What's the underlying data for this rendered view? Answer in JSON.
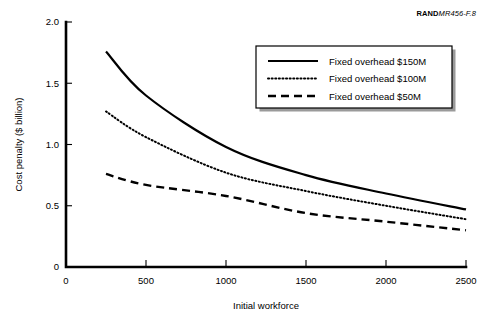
{
  "source_tag": {
    "rand_mark": "RAND",
    "doc_id": "MR456-F.8"
  },
  "chart_data": {
    "type": "line",
    "title": "",
    "xlabel": "Initial workforce",
    "ylabel": "Cost penalty ($ billion)",
    "xlim": [
      0,
      2500
    ],
    "ylim": [
      0,
      2.0
    ],
    "xticks": [
      0,
      500,
      1000,
      1500,
      2000,
      2500
    ],
    "xtick_labels": [
      "0",
      "500",
      "1000",
      "1500",
      "2000",
      "2500"
    ],
    "yticks": [
      0,
      0.5,
      1.0,
      1.5,
      2.0
    ],
    "ytick_labels": [
      "0",
      "0.5",
      "1.0",
      "1.5",
      "2.0"
    ],
    "grid": false,
    "legend_position": "upper right",
    "x": [
      250,
      500,
      1000,
      1500,
      2000,
      2500
    ],
    "series": [
      {
        "name": "Fixed overhead $150M",
        "style": "solid",
        "color": "#000000",
        "values": [
          1.76,
          1.4,
          0.98,
          0.75,
          0.6,
          0.47
        ]
      },
      {
        "name": "Fixed overhead $100M",
        "style": "dotted",
        "color": "#000000",
        "values": [
          1.27,
          1.06,
          0.77,
          0.62,
          0.5,
          0.39
        ]
      },
      {
        "name": "Fixed overhead $50M",
        "style": "dashed",
        "color": "#000000",
        "values": [
          0.76,
          0.67,
          0.58,
          0.44,
          0.37,
          0.3
        ]
      }
    ]
  }
}
